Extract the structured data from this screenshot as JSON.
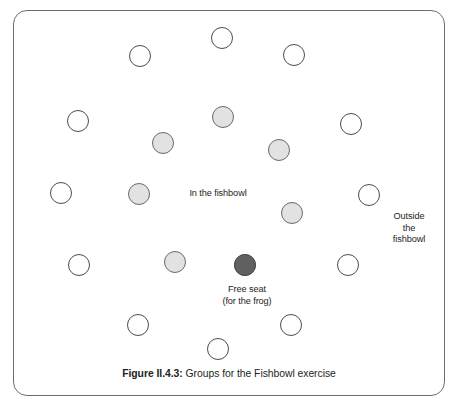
{
  "figure": {
    "caption_number": "Figure II.4.3:",
    "caption_text": " Groups for the Fishbowl exercise",
    "frame_color": "#6d6d6d"
  },
  "labels": {
    "inside": "In the fishbowl",
    "outside": "Outside\nthe\nfishbowl",
    "free_seat": "Free seat\n(for the frog)"
  },
  "colors": {
    "outside_fill": "#ffffff",
    "outside_stroke": "#4c4c4c",
    "inside_fill": "#e2e2e2",
    "inside_stroke": "#6a6a6a",
    "free_seat_fill": "#616161",
    "free_seat_stroke": "#4a4a4a",
    "text": "#231f20"
  },
  "chart_data": {
    "type": "scatter",
    "title": "Figure II.4.3: Groups for the Fishbowl exercise",
    "xlabel": "",
    "ylabel": "",
    "xlim": [
      0,
      459
    ],
    "ylim": [
      0,
      416
    ],
    "grid": false,
    "legend": null,
    "annotations": [
      {
        "text": "In the fishbowl",
        "x": 218,
        "y": 194
      },
      {
        "text": "Outside the fishbowl",
        "x": 409,
        "y": 234
      },
      {
        "text": "Free seat (for the frog)",
        "x": 247,
        "y": 295
      }
    ],
    "series": [
      {
        "name": "Outside the fishbowl",
        "marker": "open-circle",
        "fill": "#ffffff",
        "stroke": "#4c4c4c",
        "radius": 11,
        "count": 12,
        "points": [
          {
            "x": 222,
            "y": 38
          },
          {
            "x": 140,
            "y": 56
          },
          {
            "x": 294,
            "y": 55
          },
          {
            "x": 78,
            "y": 121
          },
          {
            "x": 351,
            "y": 124
          },
          {
            "x": 61,
            "y": 193
          },
          {
            "x": 369,
            "y": 195
          },
          {
            "x": 79,
            "y": 265
          },
          {
            "x": 348,
            "y": 265
          },
          {
            "x": 138,
            "y": 325
          },
          {
            "x": 291,
            "y": 325
          },
          {
            "x": 218,
            "y": 349
          }
        ]
      },
      {
        "name": "In the fishbowl",
        "marker": "filled-circle",
        "fill": "#e2e2e2",
        "stroke": "#6a6a6a",
        "radius": 11,
        "count": 7,
        "points": [
          {
            "x": 223,
            "y": 117
          },
          {
            "x": 163,
            "y": 143
          },
          {
            "x": 279,
            "y": 150
          },
          {
            "x": 139,
            "y": 194
          },
          {
            "x": 292,
            "y": 213
          },
          {
            "x": 175,
            "y": 262
          },
          {
            "x": 245,
            "y": 265
          }
        ]
      },
      {
        "name": "Free seat (for the frog)",
        "marker": "filled-circle",
        "fill": "#616161",
        "stroke": "#4a4a4a",
        "radius": 11,
        "count": 1,
        "points": [
          {
            "x": 245,
            "y": 265
          }
        ]
      }
    ]
  }
}
